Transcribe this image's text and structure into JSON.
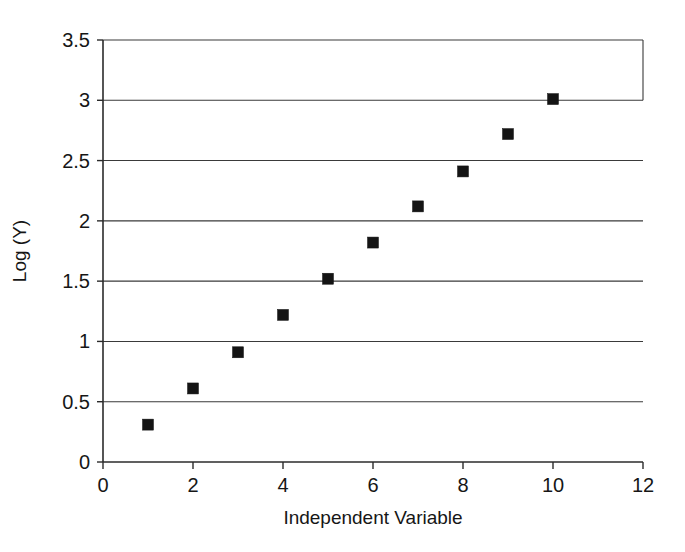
{
  "chart_data": {
    "type": "scatter",
    "title": "",
    "xlabel": "Independent Variable",
    "ylabel": "Log (Y)",
    "x": [
      1,
      2,
      3,
      4,
      5,
      6,
      7,
      8,
      9,
      10
    ],
    "values": [
      0.31,
      0.61,
      0.91,
      1.22,
      1.52,
      1.82,
      2.12,
      2.41,
      2.72,
      3.01
    ],
    "series": [
      {
        "name": "Log (Y)",
        "values": [
          0.31,
          0.61,
          0.91,
          1.22,
          1.52,
          1.82,
          2.12,
          2.41,
          2.72,
          3.01
        ]
      }
    ],
    "xlim": [
      0,
      12
    ],
    "ylim": [
      0,
      3.5
    ],
    "x_ticks": [
      0,
      2,
      4,
      6,
      8,
      10,
      12
    ],
    "x_tick_labels": [
      "0",
      "2",
      "4",
      "6",
      "8",
      "10",
      "12"
    ],
    "y_ticks": [
      0,
      0.5,
      1,
      1.5,
      2,
      2.5,
      3,
      3.5
    ],
    "y_tick_labels": [
      "0",
      "0.5",
      "1",
      "1.5",
      "2",
      "2.5",
      "3",
      "3.5"
    ],
    "grid": "horizontal",
    "legend": "none",
    "marker": "square",
    "marker_color": "#141414",
    "marker_size": 11,
    "background_color": "#ffffff",
    "axis_color": "#2b2b2b",
    "gridline_color": "#3a3a3a"
  }
}
